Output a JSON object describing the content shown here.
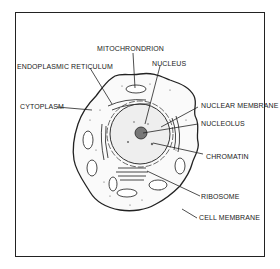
{
  "diagram": {
    "title": "",
    "type": "animal-cell-anatomy",
    "border_color": "#222222",
    "labels": [
      {
        "id": "mitochondrion",
        "text": "MITOCHRONDRION"
      },
      {
        "id": "endoplasmic-reticulum",
        "text": "ENDOPLASMIC RETICULUM"
      },
      {
        "id": "nucleus",
        "text": "NUCLEUS"
      },
      {
        "id": "cytoplasm",
        "text": "CYTOPLASM"
      },
      {
        "id": "nuclear-membrane",
        "text": "NUCLEAR MEMBRANE"
      },
      {
        "id": "nucleolus",
        "text": "NUCLEOLUS"
      },
      {
        "id": "chromatin",
        "text": "CHROMATIN"
      },
      {
        "id": "ribosome",
        "text": "RIBOSOME"
      },
      {
        "id": "cell-membrane",
        "text": "CELL MEMBRANE"
      }
    ]
  }
}
